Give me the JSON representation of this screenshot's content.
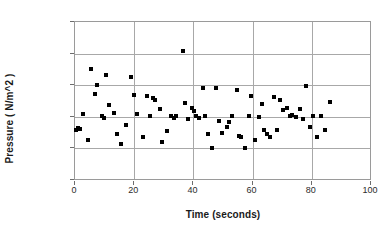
{
  "chart_data": {
    "type": "scatter",
    "title": "",
    "xlabel": "Time (seconds)",
    "ylabel": "Pressure ( N/m^2 )",
    "xlim": [
      0,
      100
    ],
    "ylim": [
      0,
      25000
    ],
    "xticks": [
      0,
      20,
      40,
      60,
      80,
      100
    ],
    "yticks": [
      0,
      5000,
      10000,
      15000,
      20000,
      25000
    ],
    "xtick_labels": [
      "0",
      "20",
      "40",
      "60",
      "80",
      "100"
    ],
    "ytick_labels": [
      "0",
      "5000",
      "10000",
      "15000",
      "20000",
      "25000"
    ],
    "grid": "horizontal-and-vertical",
    "legend": "none",
    "marker": "filled-square",
    "marker_color": "#000000",
    "series": [
      {
        "name": "Pressure",
        "points": [
          [
            0.4,
            7900
          ],
          [
            1.0,
            8300
          ],
          [
            1.6,
            8100
          ],
          [
            2.6,
            10400
          ],
          [
            4.3,
            6400
          ],
          [
            5.4,
            17500
          ],
          [
            6.8,
            13550
          ],
          [
            7.6,
            15100
          ],
          [
            9.2,
            10150
          ],
          [
            9.9,
            9800
          ],
          [
            10.4,
            16650
          ],
          [
            11.6,
            11900
          ],
          [
            13.2,
            10550
          ],
          [
            14.3,
            7250
          ],
          [
            15.6,
            5700
          ],
          [
            17.2,
            8700
          ],
          [
            19.0,
            16250
          ],
          [
            19.9,
            13500
          ],
          [
            21.1,
            10450
          ],
          [
            22.9,
            6750
          ],
          [
            24.3,
            13350
          ],
          [
            25.4,
            10150
          ],
          [
            26.2,
            13050
          ],
          [
            27.1,
            12600
          ],
          [
            28.7,
            11200
          ],
          [
            29.4,
            6050
          ],
          [
            31.0,
            7700
          ],
          [
            32.6,
            10050
          ],
          [
            33.4,
            9800
          ],
          [
            34.2,
            10100
          ],
          [
            36.6,
            20350
          ],
          [
            37.1,
            12150
          ],
          [
            38.2,
            9650
          ],
          [
            39.5,
            11450
          ],
          [
            40.3,
            10850
          ],
          [
            41.0,
            10050
          ],
          [
            41.9,
            9750
          ],
          [
            43.3,
            14550
          ],
          [
            44.0,
            10200
          ],
          [
            44.8,
            7350
          ],
          [
            46.4,
            5100
          ],
          [
            47.5,
            14550
          ],
          [
            48.6,
            9350
          ],
          [
            49.6,
            7500
          ],
          [
            51.2,
            8400
          ],
          [
            52.0,
            9150
          ],
          [
            53.2,
            10150
          ],
          [
            54.6,
            14300
          ],
          [
            55.5,
            7000
          ],
          [
            56.1,
            6800
          ],
          [
            57.4,
            5100
          ],
          [
            58.7,
            10100
          ],
          [
            59.6,
            13300
          ],
          [
            60.8,
            6400
          ],
          [
            62.3,
            9950
          ],
          [
            63.1,
            12100
          ],
          [
            64.0,
            7950
          ],
          [
            64.9,
            7200
          ],
          [
            66.0,
            6750
          ],
          [
            67.1,
            13200
          ],
          [
            68.2,
            7900
          ],
          [
            69.3,
            12650
          ],
          [
            70.4,
            11050
          ],
          [
            71.5,
            11400
          ],
          [
            72.6,
            10100
          ],
          [
            73.4,
            10250
          ],
          [
            74.5,
            9950
          ],
          [
            76.0,
            11300
          ],
          [
            77.1,
            9600
          ],
          [
            78.0,
            14950
          ],
          [
            79.4,
            8400
          ],
          [
            80.5,
            10150
          ],
          [
            81.6,
            6750
          ],
          [
            83.0,
            10050
          ],
          [
            84.5,
            7900
          ],
          [
            86.0,
            12350
          ]
        ]
      }
    ]
  }
}
